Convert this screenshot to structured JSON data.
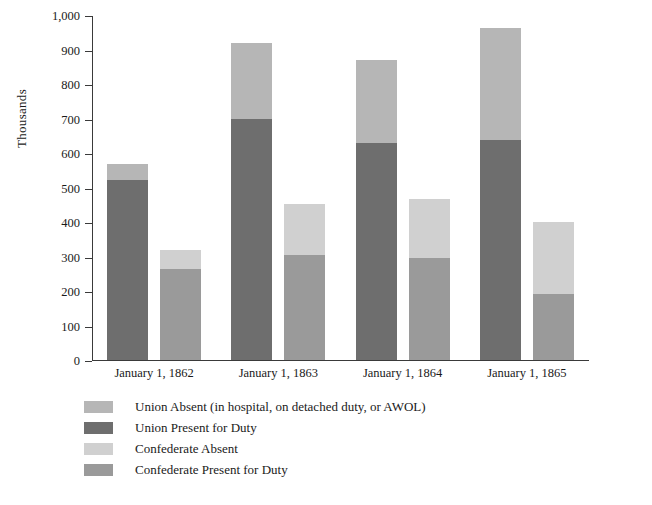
{
  "chart_data": {
    "type": "bar",
    "subtype": "grouped-stacked",
    "title": "",
    "xlabel": "",
    "ylabel": "Thousands",
    "ylim": [
      0,
      1000
    ],
    "ytick_interval": 100,
    "ytick_labels": [
      "1,000",
      "900",
      "800",
      "700",
      "600",
      "500",
      "400",
      "300",
      "200",
      "100",
      "0"
    ],
    "ytick_values": [
      1000,
      900,
      800,
      700,
      600,
      500,
      400,
      300,
      200,
      100,
      0
    ],
    "grid": false,
    "legend_position": "bottom-left",
    "categories": [
      "January 1, 1862",
      "January 1, 1863",
      "January 1, 1864",
      "January 1, 1865"
    ],
    "series": [
      {
        "name": "Union Present for Duty",
        "stack": "Union",
        "color": "#6e6e6e",
        "values": [
          522,
          698,
          629,
          638
        ]
      },
      {
        "name": "Union Absent (in hospital, on detached duty, or AWOL)",
        "stack": "Union",
        "color": "#b6b6b6",
        "values": [
          45,
          220,
          241,
          324
        ]
      },
      {
        "name": "Confederate Present for Duty",
        "stack": "Confederate",
        "color": "#9a9a9a",
        "values": [
          263,
          305,
          295,
          190
        ]
      },
      {
        "name": "Confederate Absent",
        "stack": "Confederate",
        "color": "#d0d0d0",
        "values": [
          57,
          147,
          172,
          210
        ]
      }
    ],
    "stack_totals": {
      "Union": [
        567,
        918,
        870,
        962
      ],
      "Confederate": [
        320,
        452,
        467,
        400
      ]
    },
    "annotations": []
  },
  "axis": {
    "y_title": "Thousands",
    "ticks": [
      {
        "label": "1,000",
        "value": 1000
      },
      {
        "label": "900",
        "value": 900
      },
      {
        "label": "800",
        "value": 800
      },
      {
        "label": "700",
        "value": 700
      },
      {
        "label": "600",
        "value": 600
      },
      {
        "label": "500",
        "value": 500
      },
      {
        "label": "400",
        "value": 400
      },
      {
        "label": "300",
        "value": 300
      },
      {
        "label": "200",
        "value": 200
      },
      {
        "label": "100",
        "value": 100
      },
      {
        "label": "0",
        "value": 0
      }
    ],
    "x_labels": [
      "January 1, 1862",
      "January 1, 1863",
      "January 1, 1864",
      "January 1, 1865"
    ]
  },
  "legend": {
    "items": [
      {
        "label": "Union Absent (in hospital, on detached duty, or AWOL)",
        "color": "#b6b6b6"
      },
      {
        "label": "Union Present for Duty",
        "color": "#6e6e6e"
      },
      {
        "label": "Confederate Absent",
        "color": "#d0d0d0"
      },
      {
        "label": "Confederate Present for Duty",
        "color": "#9a9a9a"
      }
    ]
  },
  "colors": {
    "union_absent": "#b6b6b6",
    "union_present": "#6e6e6e",
    "confederate_absent": "#d0d0d0",
    "confederate_present": "#9a9a9a",
    "axis": "#3a3a3a",
    "text": "#1a1a1a",
    "background": "#ffffff"
  }
}
